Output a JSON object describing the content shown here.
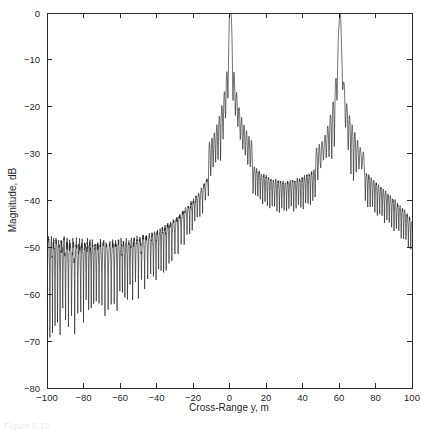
{
  "figure": {
    "background_color": "#ffffff",
    "line_color": "#1c1c1c",
    "axis_color": "#2b2b2b",
    "caption_fragment": "Figure 6.12"
  },
  "chart_data": {
    "type": "line",
    "title": "",
    "xlabel": "Cross-Range y, m",
    "ylabel": "Magnitude, dB",
    "xlim": [
      -100,
      100
    ],
    "ylim": [
      -80,
      0
    ],
    "xticks": [
      -100,
      -80,
      -60,
      -40,
      -20,
      0,
      20,
      40,
      60,
      80,
      100
    ],
    "xtick_labels": [
      "-100",
      "-80",
      "-60",
      "-40",
      "-20",
      "0",
      "20",
      "40",
      "60",
      "80",
      "100"
    ],
    "yticks": [
      0,
      -10,
      -20,
      -30,
      -40,
      -50,
      -60,
      -70,
      -80
    ],
    "ytick_labels": [
      "0",
      "-10",
      "-20",
      "-30",
      "-40",
      "-50",
      "-60",
      "-70",
      "-80"
    ],
    "grid": false,
    "legend": null,
    "series": [
      {
        "name": "Cross-range point spread response",
        "description": "Magnitude response with a main lobe peaking at 0 dB near y = 0.5 m and a secondary target peak at -2 dB near y = 60.5 m, on an oscillatory sidelobe floor that falls from about -55 dB at y = -100 m with deep nulls to -76 dB, rises toward the main lobe, and decays to about -46 dB at y = +100 m.",
        "peaks": [
          {
            "x": 0.5,
            "y": 0.0,
            "label": "main lobe"
          },
          {
            "x": 60.5,
            "y": -2.0,
            "label": "secondary target"
          }
        ],
        "envelope_points": [
          {
            "x": -100,
            "y": -55.5
          },
          {
            "x": -95,
            "y": -55.0
          },
          {
            "x": -90,
            "y": -55.2
          },
          {
            "x": -85,
            "y": -54.8
          },
          {
            "x": -80,
            "y": -54.5
          },
          {
            "x": -75,
            "y": -54.6
          },
          {
            "x": -70,
            "y": -54.2
          },
          {
            "x": -65,
            "y": -53.8
          },
          {
            "x": -60,
            "y": -53.4
          },
          {
            "x": -55,
            "y": -52.8
          },
          {
            "x": -50,
            "y": -52.0
          },
          {
            "x": -45,
            "y": -51.2
          },
          {
            "x": -40,
            "y": -50.0
          },
          {
            "x": -35,
            "y": -48.6
          },
          {
            "x": -30,
            "y": -46.8
          },
          {
            "x": -25,
            "y": -44.6
          },
          {
            "x": -20,
            "y": -42.2
          },
          {
            "x": -15,
            "y": -39.2
          },
          {
            "x": -10,
            "y": -35.4
          },
          {
            "x": -7,
            "y": -32.4
          },
          {
            "x": -5,
            "y": -29.6
          },
          {
            "x": -3,
            "y": -25.6
          },
          {
            "x": -2,
            "y": -22.6
          },
          {
            "x": -1,
            "y": -21.2
          },
          {
            "x": 0.5,
            "y": 0.0
          },
          {
            "x": 2,
            "y": -21.0
          },
          {
            "x": 3,
            "y": -22.4
          },
          {
            "x": 5,
            "y": -26.6
          },
          {
            "x": 7,
            "y": -29.6
          },
          {
            "x": 10,
            "y": -32.2
          },
          {
            "x": 14,
            "y": -34.4
          },
          {
            "x": 18,
            "y": -35.8
          },
          {
            "x": 22,
            "y": -36.6
          },
          {
            "x": 26,
            "y": -37.2
          },
          {
            "x": 30,
            "y": -37.4
          },
          {
            "x": 34,
            "y": -37.2
          },
          {
            "x": 38,
            "y": -36.8
          },
          {
            "x": 42,
            "y": -36.2
          },
          {
            "x": 46,
            "y": -35.2
          },
          {
            "x": 50,
            "y": -33.8
          },
          {
            "x": 54,
            "y": -31.2
          },
          {
            "x": 57,
            "y": -27.0
          },
          {
            "x": 59,
            "y": -17.0
          },
          {
            "x": 60.5,
            "y": -2.0
          },
          {
            "x": 62,
            "y": -17.5
          },
          {
            "x": 64,
            "y": -27.5
          },
          {
            "x": 67,
            "y": -31.6
          },
          {
            "x": 70,
            "y": -33.6
          },
          {
            "x": 75,
            "y": -35.6
          },
          {
            "x": 80,
            "y": -37.6
          },
          {
            "x": 85,
            "y": -39.4
          },
          {
            "x": 90,
            "y": -41.2
          },
          {
            "x": 95,
            "y": -43.2
          },
          {
            "x": 100,
            "y": -45.8
          }
        ]
      }
    ]
  }
}
